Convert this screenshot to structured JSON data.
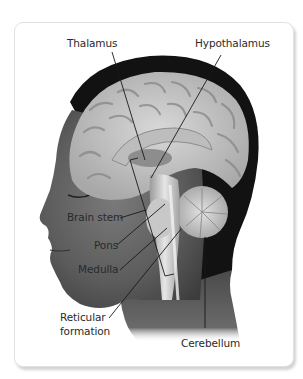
{
  "figure": {
    "labels": {
      "thalamus": "Thalamus",
      "hypothalamus": "Hypothalamus",
      "brain_stem": "Brain stem",
      "pons": "Pons",
      "medulla": "Medulla",
      "reticular_line1": "Reticular",
      "reticular_line2": "formation",
      "cerebellum": "Cerebellum"
    },
    "colors": {
      "background": "#ffffff",
      "hair": "#111111",
      "skin": "#5a5a5a",
      "brain": "#c9c9c9",
      "leader_line": "#1a1a1a",
      "label_text": "#2a2a2a"
    }
  }
}
